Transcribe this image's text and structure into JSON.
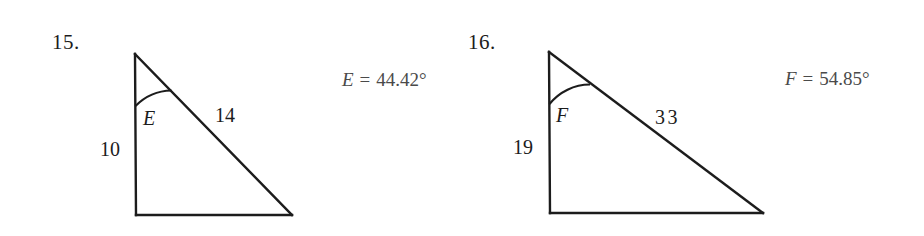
{
  "page": {
    "background_color": "#ffffff",
    "ink_color": "#1c1c1c",
    "answer_color": "#4a4a4a"
  },
  "problems": [
    {
      "number": "15.",
      "angle_label": "E",
      "vertical_side_label": "10",
      "hypotenuse_label": "14",
      "answer": {
        "variable": "E",
        "equals": "=",
        "value": "44.42°",
        "full_text": "E = 44.42°"
      },
      "geometry": {
        "apex": [
          135,
          54
        ],
        "bottom_left": [
          136,
          215
        ],
        "bottom_right": [
          292,
          215
        ],
        "arc_radius": 52
      }
    },
    {
      "number": "16.",
      "angle_label": "F",
      "vertical_side_label": "19",
      "hypotenuse_label": "33",
      "answer": {
        "variable": "F",
        "equals": "=",
        "value": "54.85°",
        "full_text": "F = 54.85°"
      },
      "geometry": {
        "apex": [
          549,
          52
        ],
        "bottom_left": [
          550,
          213
        ],
        "bottom_right": [
          763,
          213
        ],
        "arc_radius": 52
      }
    }
  ]
}
